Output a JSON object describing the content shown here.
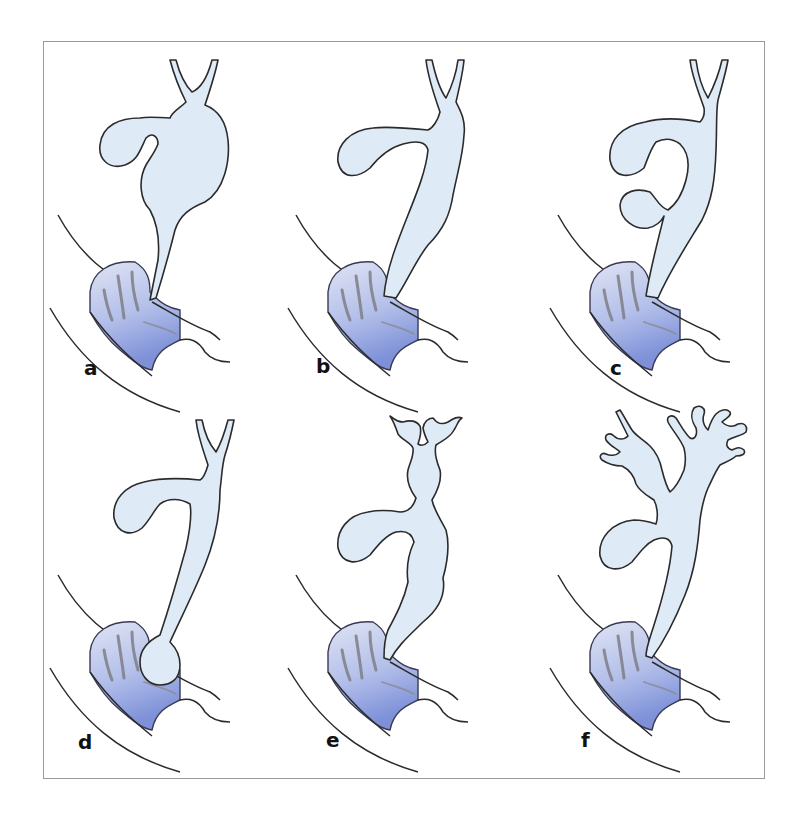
{
  "figure": {
    "panels": [
      {
        "id": "a",
        "label": "a",
        "description": "Fusiform/cystic dilatation of common bile duct"
      },
      {
        "id": "b",
        "label": "b",
        "description": "Diffuse cylindrical dilatation of common bile duct"
      },
      {
        "id": "c",
        "label": "c",
        "description": "Diverticulum of the bile duct"
      },
      {
        "id": "d",
        "label": "d",
        "description": "Choledochocele protruding into duodenum"
      },
      {
        "id": "e",
        "label": "e",
        "description": "Multiple extra- and intrahepatic cysts"
      },
      {
        "id": "f",
        "label": "f",
        "description": "Intrahepatic ductal dilatation (Caroli)"
      }
    ],
    "colors": {
      "duct_fill": "#deebf7",
      "duodenum_mucosa": "#8f9fd8",
      "outline": "#2b2b2b",
      "frame_border": "#9a9a9a"
    }
  }
}
